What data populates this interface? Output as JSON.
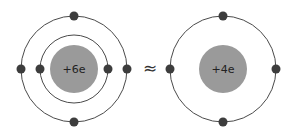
{
  "diagram": {
    "approx_symbol": "≈",
    "background": "#ffffff",
    "electron_radius": 4.5,
    "orbit_stroke_width": 1,
    "label_font_size": 11,
    "colors": {
      "nucleus": "#9a9a9a",
      "electron": "#3d3d3d",
      "orbit": "#4a4a4a",
      "label": "#222222"
    },
    "atoms": [
      {
        "name": "carbon-atom",
        "nucleus_label": "+6e",
        "center": {
          "x": 74,
          "y": 69
        },
        "nucleus_radius": 24,
        "shells": [
          {
            "radius": 34,
            "electron_angles_deg": [
              0,
              180
            ]
          },
          {
            "radius": 53,
            "electron_angles_deg": [
              0,
              90,
              180,
              270
            ]
          }
        ]
      },
      {
        "name": "equivalent-core",
        "nucleus_label": "+4e",
        "center": {
          "x": 223,
          "y": 69
        },
        "nucleus_radius": 24,
        "shells": [
          {
            "radius": 53,
            "electron_angles_deg": [
              0,
              90,
              180,
              270
            ]
          }
        ]
      }
    ]
  }
}
